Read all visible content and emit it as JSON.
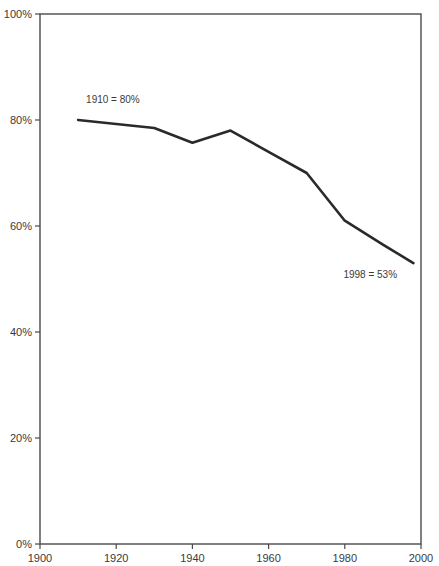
{
  "chart_data": {
    "type": "line",
    "title": "",
    "subtitle": "",
    "xlabel": "",
    "ylabel": "",
    "xlim": [
      1900,
      2000
    ],
    "ylim": [
      0,
      100
    ],
    "grid": false,
    "legend": "none",
    "x": [
      1910,
      1930,
      1940,
      1950,
      1960,
      1970,
      1980,
      1990,
      1998
    ],
    "values": [
      80,
      78.5,
      75.7,
      78,
      74,
      70,
      61,
      56.5,
      53
    ],
    "series": [
      {
        "name": "percent",
        "color": "#2a2a2a",
        "x": [
          1910,
          1930,
          1940,
          1950,
          1960,
          1970,
          1980,
          1990,
          1998
        ],
        "values": [
          80,
          78.5,
          75.7,
          78,
          74,
          70,
          61,
          56.5,
          53
        ]
      }
    ],
    "x_tick_values": [
      1900,
      1920,
      1940,
      1960,
      1980,
      2000
    ],
    "x_tick_labels": [
      "1900",
      "1920",
      "1940",
      "1960",
      "1980",
      "2000"
    ],
    "y_tick_values": [
      0,
      20,
      40,
      60,
      80,
      100
    ],
    "y_tick_labels": [
      "0%",
      "20%",
      "40%",
      "60%",
      "80%",
      "100%"
    ],
    "annotations": [
      {
        "text": "1910 = 80%",
        "x": 1910,
        "y": 80,
        "dx": 8,
        "dy": -17
      },
      {
        "text": "1998 = 53%",
        "x": 1998,
        "y": 53,
        "dx": -70,
        "dy": 15
      }
    ]
  },
  "style": {
    "line_color": "#2a2a2a",
    "frame_color": "#4a4a4a",
    "text_color": "#3a3a3a",
    "background": "#ffffff"
  }
}
